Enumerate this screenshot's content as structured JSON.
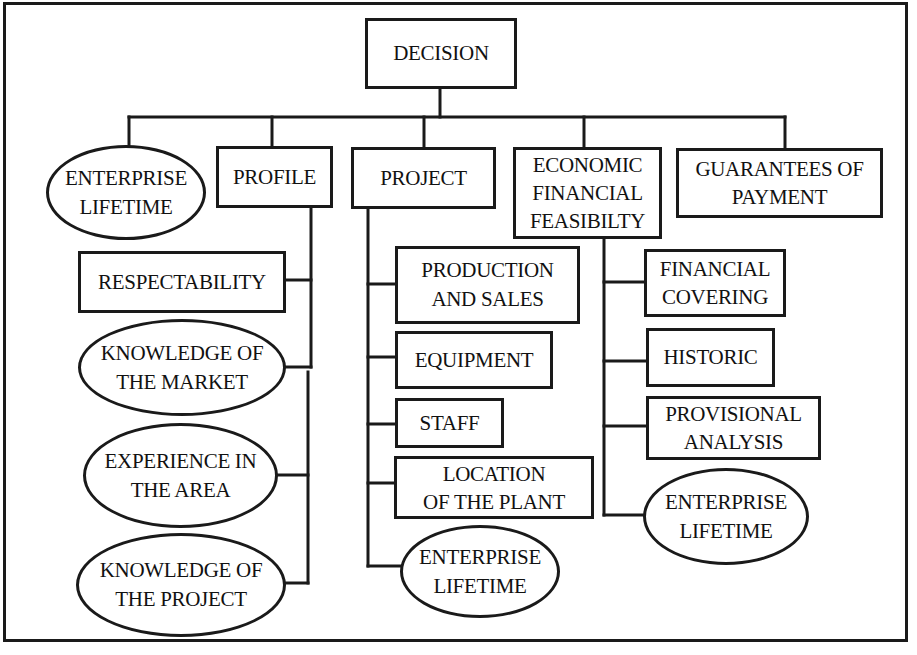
{
  "diagram": {
    "root": {
      "label": "DECISION"
    },
    "level1": [
      {
        "id": "enterprise-lifetime-1",
        "lines": [
          "ENTERPRISE",
          "LIFETIME"
        ],
        "shape": "ellipse"
      },
      {
        "id": "profile",
        "lines": [
          "PROFILE"
        ],
        "shape": "rect"
      },
      {
        "id": "project",
        "lines": [
          "PROJECT"
        ],
        "shape": "rect"
      },
      {
        "id": "economic-financial-feasibility",
        "lines": [
          "ECONOMIC",
          "FINANCIAL",
          "FEASIBILTY"
        ],
        "shape": "rect"
      },
      {
        "id": "guarantees-of-payment",
        "lines": [
          "GUARANTEES OF",
          "PAYMENT"
        ],
        "shape": "rect"
      }
    ],
    "profile_children": [
      {
        "lines": [
          "RESPECTABILITY"
        ],
        "shape": "rect"
      },
      {
        "lines": [
          "KNOWLEDGE OF",
          "THE MARKET"
        ],
        "shape": "ellipse"
      },
      {
        "lines": [
          "EXPERIENCE IN",
          "THE AREA"
        ],
        "shape": "ellipse"
      },
      {
        "lines": [
          "KNOWLEDGE OF",
          "THE PROJECT"
        ],
        "shape": "ellipse"
      }
    ],
    "project_children": [
      {
        "lines": [
          "PRODUCTION",
          "AND SALES"
        ],
        "shape": "rect"
      },
      {
        "lines": [
          "EQUIPMENT"
        ],
        "shape": "rect"
      },
      {
        "lines": [
          "STAFF"
        ],
        "shape": "rect"
      },
      {
        "lines": [
          "LOCATION",
          "OF THE PLANT"
        ],
        "shape": "rect"
      },
      {
        "lines": [
          "ENTERPRISE",
          "LIFETIME"
        ],
        "shape": "ellipse"
      }
    ],
    "economic_children": [
      {
        "lines": [
          "FINANCIAL",
          "COVERING"
        ],
        "shape": "rect"
      },
      {
        "lines": [
          "HISTORIC"
        ],
        "shape": "rect"
      },
      {
        "lines": [
          "PROVISIONAL",
          "ANALYSIS"
        ],
        "shape": "rect"
      },
      {
        "lines": [
          "ENTERPRISE",
          "LIFETIME"
        ],
        "shape": "ellipse"
      }
    ]
  },
  "colors": {
    "stroke": "#1a1a1a",
    "background": "#ffffff"
  }
}
